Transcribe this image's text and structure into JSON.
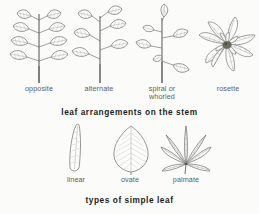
{
  "figure": {
    "background_color": "#fbfbfa",
    "ink_color": "#6b6b6b",
    "label_color": "#5e5e5e",
    "caption_color": "#1d1d1d"
  },
  "sections": [
    {
      "id": "arrangements",
      "caption": "leaf arrangements on the stem",
      "items": [
        {
          "label": "opposite",
          "icon": "opposite-leaf-plant-icon"
        },
        {
          "label": "alternate",
          "icon": "alternate-leaf-plant-icon"
        },
        {
          "label": "spiral or\nwhorled",
          "icon": "spiral-whorled-leaf-plant-icon"
        },
        {
          "label": "rosette",
          "icon": "rosette-leaf-plant-icon"
        }
      ]
    },
    {
      "id": "simple-leaf-types",
      "caption": "types of simple leaf",
      "items": [
        {
          "label": "linear",
          "icon": "linear-leaf-icon"
        },
        {
          "label": "ovate",
          "icon": "ovate-leaf-icon"
        },
        {
          "label": "palmate",
          "icon": "palmate-leaf-icon"
        }
      ]
    }
  ]
}
